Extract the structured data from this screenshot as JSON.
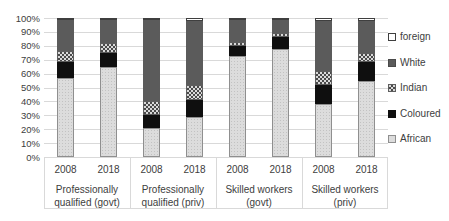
{
  "chart_data": {
    "type": "bar",
    "stacked": true,
    "percent_axis": true,
    "title": "",
    "xlabel": "",
    "ylabel": "",
    "ylim": [
      0,
      100
    ],
    "grid": true,
    "legend_position": "right",
    "ytick_labels": [
      "0%",
      "10%",
      "20%",
      "30%",
      "40%",
      "50%",
      "60%",
      "70%",
      "80%",
      "90%",
      "100%"
    ],
    "series_bottom_to_top": [
      "African",
      "Coloured",
      "Indian",
      "White",
      "foreign"
    ],
    "colors": {
      "African": "#dcdcdc",
      "Coloured": "#0f0f0f",
      "Indian": "checker-pattern",
      "White": "#5b5b5b",
      "foreign": "#ffffff"
    },
    "legend": [
      {
        "label": "foreign",
        "swatch": "foreign"
      },
      {
        "label": "White",
        "swatch": "White"
      },
      {
        "label": "Indian",
        "swatch": "Indian"
      },
      {
        "label": "Coloured",
        "swatch": "Coloured"
      },
      {
        "label": "African",
        "swatch": "African"
      }
    ],
    "groups": [
      {
        "label_lines": [
          "Professionally",
          "qualified (govt)"
        ],
        "bars": [
          {
            "year": "2008",
            "values": {
              "African": 57,
              "Coloured": 11,
              "Indian": 8,
              "White": 23,
              "foreign": 1
            }
          },
          {
            "year": "2018",
            "values": {
              "African": 65,
              "Coloured": 10,
              "Indian": 7,
              "White": 17,
              "foreign": 1
            }
          }
        ]
      },
      {
        "label_lines": [
          "Professionally",
          "qualified (priv)"
        ],
        "bars": [
          {
            "year": "2008",
            "values": {
              "African": 21,
              "Coloured": 9,
              "Indian": 10,
              "White": 59,
              "foreign": 1
            }
          },
          {
            "year": "2018",
            "values": {
              "African": 29,
              "Coloured": 12,
              "Indian": 11,
              "White": 46,
              "foreign": 2
            }
          }
        ]
      },
      {
        "label_lines": [
          "Skilled workers",
          "(govt)"
        ],
        "bars": [
          {
            "year": "2008",
            "values": {
              "African": 73,
              "Coloured": 7,
              "Indian": 3,
              "White": 16,
              "foreign": 1
            }
          },
          {
            "year": "2018",
            "values": {
              "African": 78,
              "Coloured": 8,
              "Indian": 3,
              "White": 10,
              "foreign": 1
            }
          }
        ]
      },
      {
        "label_lines": [
          "Skilled workers",
          "(priv)"
        ],
        "bars": [
          {
            "year": "2008",
            "values": {
              "African": 38,
              "Coloured": 14,
              "Indian": 10,
              "White": 36,
              "foreign": 2
            }
          },
          {
            "year": "2018",
            "values": {
              "African": 55,
              "Coloured": 13,
              "Indian": 7,
              "White": 23,
              "foreign": 2
            }
          }
        ]
      }
    ]
  }
}
